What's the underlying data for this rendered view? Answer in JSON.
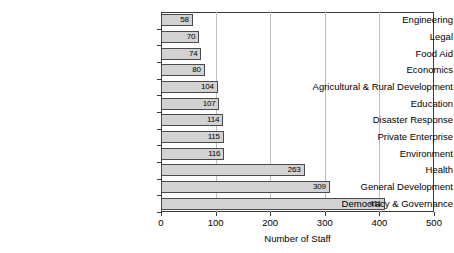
{
  "chart_data": {
    "type": "bar",
    "orientation": "horizontal",
    "title": "",
    "xlabel": "Number of Staff",
    "ylabel": "",
    "xlim": [
      0,
      500
    ],
    "xticks": [
      0,
      100,
      200,
      300,
      400,
      500
    ],
    "grid": "vertical",
    "legend": "none",
    "categories": [
      "Engineering",
      "Legal",
      "Food Aid",
      "Economics",
      "Agricultural & Rural Development",
      "Education",
      "Disaster Response",
      "Private Enterprise",
      "Environment",
      "Health",
      "General Development",
      "Democracy & Governance"
    ],
    "values": [
      58,
      70,
      74,
      80,
      104,
      107,
      114,
      115,
      116,
      263,
      309,
      411
    ],
    "bar_fill_color": "#d2d2d2",
    "bar_edge_color": "#4a4a4a",
    "gridline_color": "#bfbfbf",
    "axis_color": "#3a3a3a"
  }
}
